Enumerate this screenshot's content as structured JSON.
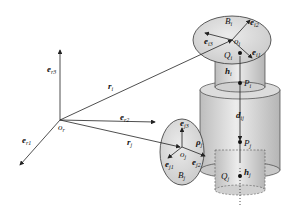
{
  "diagram": {
    "type": "multibody-kinematics",
    "colors": {
      "stroke": "#222222",
      "body_fill": "#d9d9d9",
      "cylinder_fill": "#cfcfcf",
      "background": "#ffffff"
    },
    "frame": {
      "origin": "o",
      "origin_sub": "r",
      "axes": [
        {
          "name": "e",
          "sub": "r1"
        },
        {
          "name": "e",
          "sub": "r2"
        },
        {
          "name": "e",
          "sub": "r3"
        }
      ]
    },
    "vectors": {
      "r_i": {
        "name": "r",
        "sub": "i"
      },
      "r_j": {
        "name": "r",
        "sub": "j"
      },
      "rho_j": {
        "name": "ρ",
        "sub": "j"
      },
      "d_ij": {
        "name": "d",
        "sub": "ij"
      },
      "h_i": {
        "name": "h",
        "sub": "i"
      },
      "h_j": {
        "name": "h",
        "sub": "j"
      }
    },
    "body_i": {
      "label": "B",
      "label_sub": "i",
      "origin": "o",
      "origin_sub": "i",
      "axes": [
        {
          "name": "e",
          "sub": "i1"
        },
        {
          "name": "e",
          "sub": "i2"
        },
        {
          "name": "e",
          "sub": "i3"
        }
      ]
    },
    "body_j": {
      "label": "B",
      "label_sub": "j",
      "origin": "o",
      "origin_sub": "j",
      "axes": [
        {
          "name": "e",
          "sub": "j1"
        },
        {
          "name": "e",
          "sub": "j2"
        },
        {
          "name": "e",
          "sub": "j3"
        }
      ]
    },
    "points": [
      {
        "name": "Q",
        "sub": "i"
      },
      {
        "name": "P",
        "sub": "i"
      },
      {
        "name": "P",
        "sub": "j"
      },
      {
        "name": "Q",
        "sub": "j"
      }
    ]
  }
}
